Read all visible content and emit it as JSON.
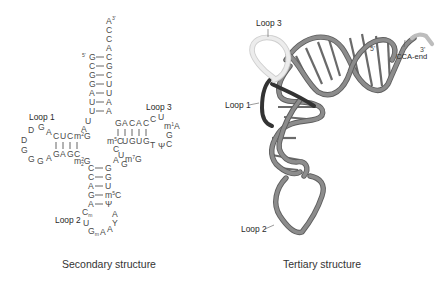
{
  "figure": {
    "secondary": {
      "caption": "Secondary structure",
      "labels": {
        "loop1": "Loop 1",
        "loop2": "Loop 2",
        "loop3": "Loop 3",
        "five_prime": "5'",
        "three_prime": "3'"
      },
      "acceptor_stem": {
        "overhang": [
          "A",
          "C",
          "C",
          "A"
        ],
        "left": [
          "G",
          "C",
          "G",
          "G",
          "A",
          "U",
          "U"
        ],
        "right": [
          "C",
          "G",
          "C",
          "U",
          "U",
          "A",
          "A"
        ]
      },
      "d_arm": {
        "top": [
          "C",
          "U",
          "C",
          "m2G"
        ],
        "bottom": [
          "G",
          "A",
          "G",
          "C"
        ],
        "loop": [
          "A",
          "G",
          "D",
          "D",
          "G",
          "G",
          "A"
        ],
        "connector_top": [
          "U",
          "A"
        ],
        "connector_bottom": "m22G"
      },
      "t_arm": {
        "top": [
          "G",
          "A",
          "C",
          "A",
          "C"
        ],
        "bottom": [
          "m5C",
          "U",
          "G",
          "U",
          "G"
        ],
        "loop": [
          "C",
          "U",
          "m1A",
          "G",
          "C",
          "Ψ",
          "T"
        ]
      },
      "variable_loop": [
        "C",
        "U",
        "m7G",
        "G",
        "A"
      ],
      "anticodon_stem": {
        "left": [
          "C",
          "C",
          "A",
          "G",
          "A"
        ],
        "right": [
          "G",
          "G",
          "U",
          "m5C",
          "Ψ"
        ]
      },
      "anticodon_loop": [
        "Cm",
        "U",
        "Gm",
        "A",
        "A",
        "Y",
        "A"
      ]
    },
    "tertiary": {
      "caption": "Tertiary structure",
      "labels": {
        "loop1": "Loop 1",
        "loop2": "Loop 2",
        "loop3": "Loop 3",
        "five_prime": "5'",
        "three_prime": "3'",
        "cca_end": "CCA-end"
      },
      "colors": {
        "backbone": "#8a8a8a",
        "backbone_edge": "#5e5e5e",
        "loop1": "#3a3a3a",
        "loop3": "#e6e6e6",
        "cca": "#bdbdbd"
      }
    }
  }
}
